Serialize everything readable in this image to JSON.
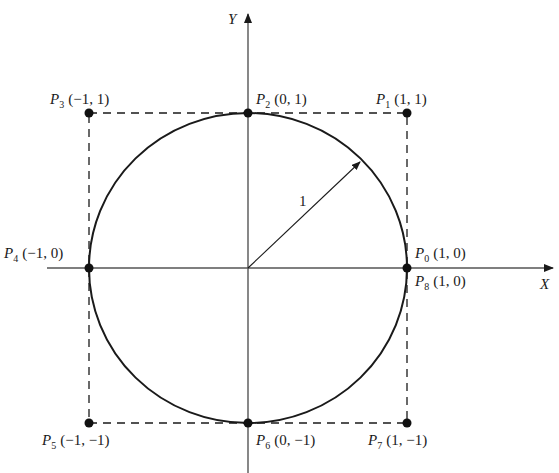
{
  "diagram": {
    "type": "unit-circle-with-bounding-square",
    "colors": {
      "stroke": "#1a1a1a",
      "axis": "#555555",
      "background": "#ffffff"
    },
    "axes": {
      "x_label": "X",
      "y_label": "Y"
    },
    "radius_label": "1",
    "points": [
      {
        "id": "P0",
        "name": "P",
        "sub": "0",
        "coords": "(1, 0)"
      },
      {
        "id": "P1",
        "name": "P",
        "sub": "1",
        "coords": "(1, 1)"
      },
      {
        "id": "P2",
        "name": "P",
        "sub": "2",
        "coords": "(0, 1)"
      },
      {
        "id": "P3",
        "name": "P",
        "sub": "3",
        "coords": "(−1, 1)"
      },
      {
        "id": "P4",
        "name": "P",
        "sub": "4",
        "coords": "(−1, 0)"
      },
      {
        "id": "P5",
        "name": "P",
        "sub": "5",
        "coords": "(−1, −1)"
      },
      {
        "id": "P6",
        "name": "P",
        "sub": "6",
        "coords": "(0, −1)"
      },
      {
        "id": "P7",
        "name": "P",
        "sub": "7",
        "coords": "(1, −1)"
      },
      {
        "id": "P8",
        "name": "P",
        "sub": "8",
        "coords": "(1, 0)"
      }
    ]
  }
}
